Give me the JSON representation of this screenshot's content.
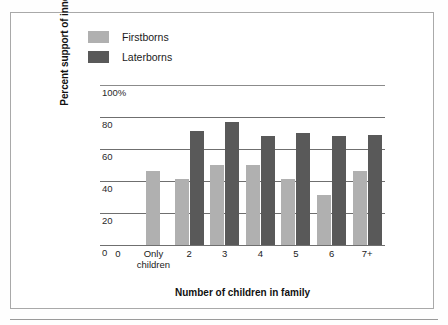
{
  "chart_data": {
    "type": "bar",
    "title": "",
    "xlabel": "Number of children in family",
    "ylabel": "Percent support of innovation",
    "categories": [
      "Only children",
      "2",
      "3",
      "4",
      "5",
      "6",
      "7+"
    ],
    "series": [
      {
        "name": "Firstborns",
        "color": "#b0b0b0",
        "values": [
          46,
          41,
          50,
          50,
          41,
          31,
          46
        ]
      },
      {
        "name": "Laterborns",
        "color": "#595959",
        "values": [
          null,
          71,
          77,
          68,
          70,
          68,
          69
        ]
      }
    ],
    "ylim": [
      0,
      100
    ],
    "yticks": [
      "0",
      "20",
      "40",
      "60",
      "80",
      "100%"
    ],
    "ytick_values": [
      0,
      20,
      40,
      60,
      80,
      100
    ],
    "xticks": [
      "0",
      "Only children",
      "2",
      "3",
      "4",
      "5",
      "6",
      "7+"
    ],
    "grid": true,
    "legend_position": "top-left"
  },
  "legend": {
    "items": [
      {
        "label": "Firstborns",
        "color": "#b0b0b0"
      },
      {
        "label": "Laterborns",
        "color": "#595959"
      }
    ]
  },
  "axes": {
    "y_title": "Percent support of innovation",
    "x_title": "Number of children in family",
    "y_ticks": [
      {
        "label": "100%",
        "value": 100
      },
      {
        "label": "80",
        "value": 80
      },
      {
        "label": "60",
        "value": 60
      },
      {
        "label": "40",
        "value": 40
      },
      {
        "label": "20",
        "value": 20
      },
      {
        "label": "0",
        "value": 0
      }
    ],
    "x_ticks": [
      {
        "line1": "0",
        "line2": ""
      },
      {
        "line1": "Only",
        "line2": "children"
      },
      {
        "line1": "2",
        "line2": ""
      },
      {
        "line1": "3",
        "line2": ""
      },
      {
        "line1": "4",
        "line2": ""
      },
      {
        "line1": "5",
        "line2": ""
      },
      {
        "line1": "6",
        "line2": ""
      },
      {
        "line1": "7+",
        "line2": ""
      }
    ]
  },
  "colors": {
    "firstborns": "#b0b0b0",
    "laterborns": "#595959",
    "gridline": "#6f6f6f",
    "frame": "#a9a9a9"
  }
}
